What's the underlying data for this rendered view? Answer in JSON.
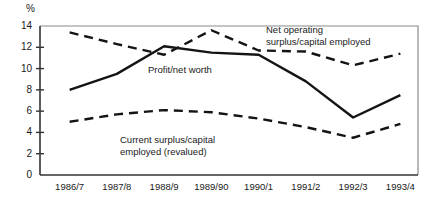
{
  "chart_data": {
    "type": "line",
    "title": "",
    "xlabel": "",
    "ylabel": "%",
    "ylim": [
      0,
      14
    ],
    "yticks": [
      0,
      2,
      4,
      6,
      8,
      10,
      12,
      14
    ],
    "grid": false,
    "legend_position": "inline-annotations",
    "categories": [
      "1986/7",
      "1987/8",
      "1988/9",
      "1989/90",
      "1990/1",
      "1991/2",
      "1992/3",
      "1993/4"
    ],
    "series": [
      {
        "name": "Net operating surplus/capital employed",
        "style": "dashed",
        "color": "#141414",
        "values": [
          13.4,
          12.3,
          11.3,
          13.6,
          11.7,
          11.6,
          10.3,
          11.4
        ]
      },
      {
        "name": "Profit/net worth",
        "style": "solid",
        "color": "#141414",
        "values": [
          8.0,
          9.5,
          12.1,
          11.5,
          11.3,
          8.8,
          5.4,
          7.5
        ]
      },
      {
        "name": "Current surplus/capital employed (revalued)",
        "style": "dashed",
        "color": "#141414",
        "values": [
          5.0,
          5.7,
          6.1,
          5.9,
          5.3,
          4.5,
          3.5,
          4.8
        ]
      }
    ],
    "annotations": [
      {
        "id": "net-operating",
        "line1": "Net operating",
        "line2": "surplus/capital employed"
      },
      {
        "id": "profit-net-worth",
        "line1": "Profit/net worth",
        "line2": ""
      },
      {
        "id": "current-surplus",
        "line1": "Current surplus/capital",
        "line2": "employed (revalued)"
      }
    ],
    "axis_unit": "%"
  }
}
